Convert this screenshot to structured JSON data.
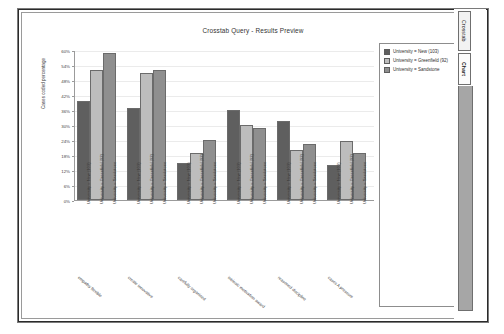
{
  "window": {
    "title": "Crosstab Query - Results Preview"
  },
  "tabs": [
    {
      "name": "crosstab",
      "label": "Crosstab",
      "selected": false
    },
    {
      "name": "chart",
      "label": "Chart",
      "selected": true
    }
  ],
  "legend": {
    "entries": [
      {
        "label": "University = New (103)",
        "color": "#5f5f5f"
      },
      {
        "label": "University = Greenfield (92)",
        "color": "#bdbdbd"
      },
      {
        "label": "University = Sandstone",
        "color": "#8f8f8f"
      }
    ]
  },
  "chart_data": {
    "type": "bar",
    "title": "Crosstab Query - Results Preview",
    "xlabel": "",
    "ylabel": "Cases coded percentage",
    "ylim": [
      0,
      60
    ],
    "ytick_labels": [
      "0%",
      "6%",
      "12%",
      "18%",
      "24%",
      "30%",
      "36%",
      "42%",
      "48%",
      "54%",
      "60%"
    ],
    "ytick_values": [
      0,
      6,
      12,
      18,
      24,
      30,
      36,
      42,
      48,
      54,
      60
    ],
    "grid": true,
    "legend_position": "right",
    "categories": [
      "empathy flexible",
      "create innovative",
      "carefully organised",
      "intrinsic motivation award",
      "reasoned discipline",
      "cases A pressure"
    ],
    "series": [
      {
        "name": "University = New (103)",
        "color": "#5f5f5f",
        "values": [
          39.5,
          37.0,
          15.0,
          36.0,
          31.5,
          14.0
        ]
      },
      {
        "name": "University = Greenfield (92)",
        "color": "#bdbdbd",
        "values": [
          52.0,
          51.0,
          19.0,
          30.0,
          20.0,
          23.5
        ]
      },
      {
        "name": "University = Sandstone",
        "color": "#8f8f8f",
        "values": [
          59.0,
          52.0,
          24.0,
          29.0,
          22.5,
          19.0
        ]
      }
    ],
    "tick_labels_per_group": [
      "University = New (103)",
      "University = Greenfield (92)",
      "University = Sandstone"
    ]
  }
}
